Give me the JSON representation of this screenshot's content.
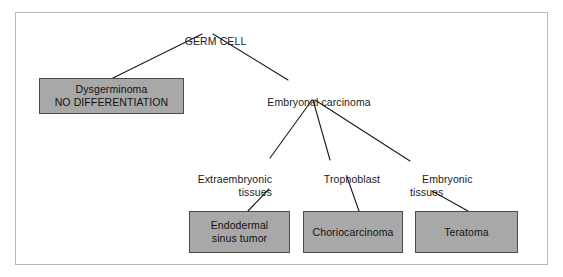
{
  "diagram": {
    "title_node": "GERM CELL",
    "root": {
      "label": "GERM CELL"
    },
    "nodes": {
      "dysgerminoma": {
        "label": "Dysgerminoma\nNO DIFFERENTIATION",
        "kind": "box"
      },
      "embryonal_carcinoma": {
        "label": "Embryonal carcinoma",
        "kind": "text"
      },
      "extraembryonic_tissues": {
        "label": "Extraembryonic\ntissues",
        "kind": "text"
      },
      "trophoblast": {
        "label": "Trophoblast",
        "kind": "text"
      },
      "embryonic_tissues": {
        "label": "Embryonic\ntissues",
        "kind": "text"
      },
      "endodermal_sinus_tumor": {
        "label": "Endodermal\nsinus tumor",
        "kind": "box"
      },
      "choriocarcinoma": {
        "label": "Choriocarcinoma",
        "kind": "box"
      },
      "teratoma": {
        "label": "Teratoma",
        "kind": "box"
      }
    },
    "colors": {
      "box_fill": "#a8a8a8",
      "box_border": "#4a4a4a",
      "line": "#1a1a1a",
      "frame": "#b8b8b8",
      "text": "#111111",
      "background": "#ffffff"
    },
    "edges": [
      {
        "from": "GERM CELL",
        "to": "Dysgerminoma"
      },
      {
        "from": "GERM CELL",
        "to": "Embryonal carcinoma"
      },
      {
        "from": "Embryonal carcinoma",
        "to": "Extraembryonic tissues"
      },
      {
        "from": "Embryonal carcinoma",
        "to": "Trophoblast"
      },
      {
        "from": "Embryonal carcinoma",
        "to": "Embryonic tissues"
      },
      {
        "from": "Extraembryonic tissues",
        "to": "Endodermal sinus tumor"
      },
      {
        "from": "Trophoblast",
        "to": "Choriocarcinoma"
      },
      {
        "from": "Embryonic tissues",
        "to": "Teratoma"
      }
    ]
  }
}
